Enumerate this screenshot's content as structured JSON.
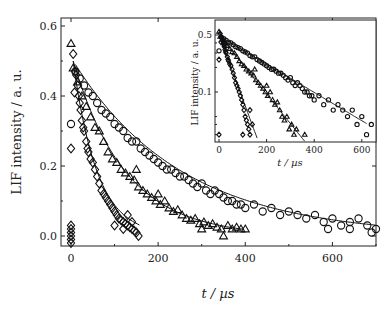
{
  "chart_data": [
    {
      "type": "scatter",
      "title": "",
      "xlabel": "t / µs",
      "ylabel": "LIF intensity / a. u.",
      "xlim": [
        -20,
        700
      ],
      "ylim": [
        -0.03,
        0.63
      ],
      "xticks": [
        0,
        200,
        400,
        600
      ],
      "xtick_labels": [
        "0",
        "200",
        "400",
        "600"
      ],
      "yticks": [
        0.0,
        0.2,
        0.4,
        0.6
      ],
      "ytick_labels": [
        "0.0",
        "0.2",
        "0.4",
        "0.6"
      ],
      "grid": false,
      "legend": null,
      "series": [
        {
          "name": "diamonds",
          "marker": "diamond",
          "fit": {
            "type": "exp",
            "A": 0.5,
            "tau": 55,
            "t0": 5,
            "t_end": 160
          },
          "points": [
            [
              0,
              0.03
            ],
            [
              0,
              0.02
            ],
            [
              0,
              0.01
            ],
            [
              0,
              0.0
            ],
            [
              0,
              -0.01
            ],
            [
              0,
              -0.02
            ],
            [
              0,
              0.25
            ],
            [
              5,
              0.52
            ],
            [
              10,
              0.47
            ],
            [
              12,
              0.46
            ],
            [
              15,
              0.43
            ],
            [
              8,
              0.41
            ],
            [
              18,
              0.4
            ],
            [
              20,
              0.38
            ],
            [
              22,
              0.36
            ],
            [
              25,
              0.33
            ],
            [
              28,
              0.31
            ],
            [
              30,
              0.3
            ],
            [
              35,
              0.27
            ],
            [
              38,
              0.25
            ],
            [
              40,
              0.24
            ],
            [
              45,
              0.22
            ],
            [
              50,
              0.21
            ],
            [
              55,
              0.19
            ],
            [
              60,
              0.17
            ],
            [
              65,
              0.15
            ],
            [
              70,
              0.13
            ],
            [
              75,
              0.12
            ],
            [
              80,
              0.11
            ],
            [
              85,
              0.1
            ],
            [
              90,
              0.09
            ],
            [
              95,
              0.08
            ],
            [
              100,
              0.07
            ],
            [
              105,
              0.06
            ],
            [
              110,
              0.05
            ],
            [
              115,
              0.045
            ],
            [
              120,
              0.04
            ],
            [
              125,
              0.035
            ],
            [
              130,
              0.03
            ],
            [
              135,
              0.025
            ],
            [
              140,
              0.02
            ],
            [
              145,
              0.015
            ],
            [
              150,
              0.01
            ],
            [
              155,
              0.0
            ],
            [
              100,
              0.03
            ],
            [
              120,
              0.02
            ],
            [
              140,
              0.04
            ],
            [
              130,
              0.06
            ]
          ]
        },
        {
          "name": "triangles",
          "marker": "triangle",
          "fit": {
            "type": "exp",
            "A": 0.5,
            "tau": 120,
            "t0": 5,
            "t_end": 400
          },
          "points": [
            [
              0,
              0.55
            ],
            [
              5,
              0.48
            ],
            [
              15,
              0.44
            ],
            [
              25,
              0.4
            ],
            [
              35,
              0.37
            ],
            [
              45,
              0.34
            ],
            [
              55,
              0.31
            ],
            [
              65,
              0.3
            ],
            [
              75,
              0.27
            ],
            [
              85,
              0.24
            ],
            [
              95,
              0.22
            ],
            [
              105,
              0.21
            ],
            [
              115,
              0.19
            ],
            [
              125,
              0.18
            ],
            [
              135,
              0.17
            ],
            [
              145,
              0.16
            ],
            [
              155,
              0.14
            ],
            [
              165,
              0.13
            ],
            [
              175,
              0.12
            ],
            [
              185,
              0.11
            ],
            [
              195,
              0.1
            ],
            [
              205,
              0.09
            ],
            [
              215,
              0.1
            ],
            [
              225,
              0.08
            ],
            [
              235,
              0.07
            ],
            [
              245,
              0.075
            ],
            [
              255,
              0.06
            ],
            [
              265,
              0.05
            ],
            [
              275,
              0.045
            ],
            [
              285,
              0.05
            ],
            [
              295,
              0.035
            ],
            [
              305,
              0.04
            ],
            [
              315,
              0.03
            ],
            [
              325,
              0.035
            ],
            [
              335,
              0.025
            ],
            [
              345,
              0.02
            ],
            [
              350,
              0.0
            ],
            [
              360,
              0.03
            ],
            [
              370,
              0.02
            ],
            [
              380,
              0.025
            ],
            [
              390,
              0.02
            ],
            [
              400,
              0.02
            ],
            [
              300,
              0.02
            ],
            [
              150,
              0.19
            ],
            [
              200,
              0.12
            ]
          ]
        },
        {
          "name": "circles",
          "marker": "circle",
          "fit": {
            "type": "exp",
            "A": 0.49,
            "tau": 250,
            "t0": 10,
            "t_end": 700
          },
          "points": [
            [
              0,
              0.32
            ],
            [
              10,
              0.47
            ],
            [
              20,
              0.45
            ],
            [
              30,
              0.43
            ],
            [
              40,
              0.41
            ],
            [
              50,
              0.4
            ],
            [
              60,
              0.38
            ],
            [
              70,
              0.36
            ],
            [
              80,
              0.35
            ],
            [
              90,
              0.34
            ],
            [
              100,
              0.32
            ],
            [
              110,
              0.31
            ],
            [
              120,
              0.3
            ],
            [
              130,
              0.28
            ],
            [
              140,
              0.27
            ],
            [
              150,
              0.27
            ],
            [
              160,
              0.25
            ],
            [
              170,
              0.24
            ],
            [
              180,
              0.23
            ],
            [
              190,
              0.22
            ],
            [
              200,
              0.21
            ],
            [
              210,
              0.2
            ],
            [
              220,
              0.19
            ],
            [
              230,
              0.19
            ],
            [
              240,
              0.18
            ],
            [
              250,
              0.17
            ],
            [
              260,
              0.17
            ],
            [
              270,
              0.16
            ],
            [
              280,
              0.15
            ],
            [
              290,
              0.14
            ],
            [
              300,
              0.15
            ],
            [
              310,
              0.13
            ],
            [
              320,
              0.12
            ],
            [
              330,
              0.13
            ],
            [
              340,
              0.12
            ],
            [
              350,
              0.11
            ],
            [
              360,
              0.1
            ],
            [
              370,
              0.1
            ],
            [
              380,
              0.09
            ],
            [
              390,
              0.09
            ],
            [
              400,
              0.08
            ],
            [
              420,
              0.09
            ],
            [
              440,
              0.07
            ],
            [
              460,
              0.08
            ],
            [
              480,
              0.06
            ],
            [
              500,
              0.07
            ],
            [
              520,
              0.06
            ],
            [
              540,
              0.05
            ],
            [
              560,
              0.06
            ],
            [
              580,
              0.04
            ],
            [
              600,
              0.05
            ],
            [
              620,
              0.03
            ],
            [
              640,
              0.04
            ],
            [
              660,
              0.05
            ],
            [
              680,
              0.03
            ],
            [
              700,
              0.02
            ],
            [
              590,
              0.02
            ],
            [
              640,
              0.02
            ],
            [
              690,
              0.01
            ]
          ]
        }
      ]
    },
    {
      "type": "scatter",
      "title": "inset (semi-log)",
      "xlabel": "t / µs",
      "ylabel": "LIF intensity / a. u.",
      "yscale": "log",
      "xlim": [
        -10,
        620
      ],
      "ylim": [
        0.02,
        0.6
      ],
      "xticks": [
        0,
        200,
        400,
        600
      ],
      "xtick_labels": [
        "0",
        "200",
        "400",
        "600"
      ],
      "yticks": [
        0.5,
        0.1
      ],
      "ytick_labels": [
        "0.5",
        "0.1"
      ],
      "grid": false,
      "series": [
        {
          "name": "diamonds",
          "marker": "diamond",
          "fit": {
            "A": 0.5,
            "tau": 55,
            "t_end": 160
          }
        },
        {
          "name": "triangles",
          "marker": "triangle",
          "fit": {
            "A": 0.5,
            "tau": 120,
            "t_end": 360
          }
        },
        {
          "name": "circles",
          "marker": "circle",
          "fit": {
            "A": 0.49,
            "tau": 250,
            "t_end": 620
          }
        }
      ]
    }
  ]
}
